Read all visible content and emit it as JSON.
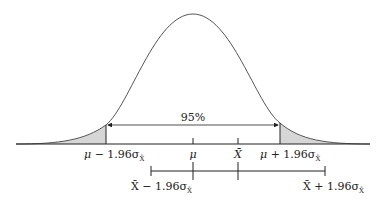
{
  "diagram": {
    "center_label": "95%",
    "axis_labels": {
      "lower_bound": {
        "sym": "μ",
        "rest": " − 1.96σ",
        "sub": "X̄"
      },
      "mean": "μ",
      "sample_mean": "X̄",
      "upper_bound": {
        "sym": "μ",
        "rest": " + 1.96σ",
        "sub": "X̄"
      }
    },
    "interval_labels": {
      "lower": {
        "sym": "X̄",
        "rest": " − 1.96σ",
        "sub": "X̄"
      },
      "upper": {
        "sym": "X̄",
        "rest": " + 1.96σ",
        "sub": "X̄"
      }
    },
    "colors": {
      "curve": "#555555",
      "line": "#222222",
      "tail_fill": "#d6d6d6"
    }
  }
}
